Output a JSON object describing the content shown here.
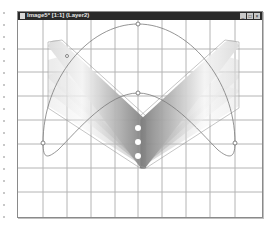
{
  "window": {
    "title": "Image5* [1:1] (Layer2)",
    "controls": {
      "minimize": "_",
      "maximize": "□",
      "close": "×"
    }
  },
  "icons": {
    "window_icon": "image-document-icon",
    "minimize": "minimize-icon",
    "maximize": "maximize-icon",
    "close": "close-icon"
  },
  "canvas": {
    "background": "#ffffff",
    "grid_color": "#b4b4b4",
    "path_color": "#7a7a7a",
    "shape_gradient": [
      "#ffffff",
      "#8c8c8c"
    ],
    "handles": [
      {
        "name": "top-arc-handle",
        "x": 138,
        "y": 24
      },
      {
        "name": "center-handle",
        "x": 138,
        "y": 93
      },
      {
        "name": "left-handle",
        "x": 43,
        "y": 143
      },
      {
        "name": "right-handle",
        "x": 235,
        "y": 143
      }
    ]
  }
}
